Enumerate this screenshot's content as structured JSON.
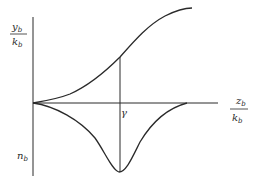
{
  "figure": {
    "y_axis_label": {
      "numerator": "y",
      "numerator_sub": "b",
      "denominator": "k",
      "denominator_sub": "b"
    },
    "x_axis_label": {
      "numerator": "z",
      "numerator_sub": "b",
      "denominator": "k",
      "denominator_sub": "b"
    },
    "lower_label": {
      "text": "n",
      "sub": "b"
    },
    "marker_label": "γ",
    "colors": {
      "line": "#2a2a2a",
      "background": "#ffffff"
    },
    "curves": [
      {
        "name": "upper-s-curve",
        "description": "rising sigmoid from origin to upper right"
      },
      {
        "name": "lower-dip-curve",
        "description": "curve dipping below axis with minimum at γ, returning to axis"
      }
    ]
  }
}
